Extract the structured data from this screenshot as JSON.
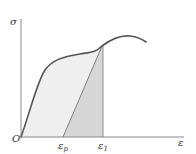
{
  "diagram": {
    "type": "stress-strain curve",
    "y_axis_label": "σ",
    "x_axis_label": "ε",
    "origin_label": "O",
    "markers": [
      {
        "symbol": "ε",
        "subscript": "p"
      },
      {
        "symbol": "ε",
        "subscript": "1"
      }
    ],
    "colors": {
      "curve": "#555555",
      "axis": "#888888",
      "elastic_region_fill": "#d6d6d6",
      "plastic_region_fill": "#efefef"
    }
  }
}
